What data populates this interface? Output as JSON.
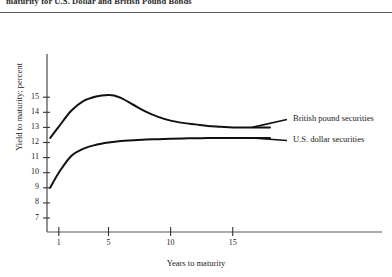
{
  "figure": {
    "top_caption": "maturity for U.S. Dollar and British Pound Bonds",
    "xaxis_title": "Years to maturity",
    "yaxis_title": "Yield to maturity; percent"
  },
  "chart_data": {
    "type": "line",
    "title": "maturity for U.S. Dollar and British Pound Bonds",
    "xlabel": "Years to maturity",
    "ylabel": "Yield to maturity; percent",
    "xlim": [
      0,
      19
    ],
    "ylim": [
      6.5,
      15.8
    ],
    "xticks": [
      1,
      5,
      10,
      15
    ],
    "xtick_labels": [
      "1",
      "5",
      "10",
      "15"
    ],
    "yticks": [
      7,
      8,
      9,
      10,
      11,
      12,
      13,
      14,
      15
    ],
    "ytick_labels": [
      "7",
      "8",
      "9",
      "10",
      "11",
      "12",
      "13",
      "14",
      "15"
    ],
    "grid": false,
    "legend_position": "right-inline",
    "series": [
      {
        "name": "British pound securities",
        "label": "British pound securities",
        "color": "#111111",
        "x": [
          0.3,
          1,
          2,
          3,
          4,
          5,
          5.5,
          6,
          7,
          8,
          9,
          10,
          11,
          12,
          13,
          14,
          15,
          16,
          17,
          18
        ],
        "values": [
          12.3,
          13.05,
          14.1,
          14.75,
          15.05,
          15.15,
          15.1,
          14.95,
          14.5,
          14.05,
          13.7,
          13.45,
          13.3,
          13.2,
          13.1,
          13.05,
          13.0,
          13.0,
          13.0,
          13.0
        ]
      },
      {
        "name": "U.S. dollar securities",
        "label": "U.S. dollar securities",
        "color": "#111111",
        "x": [
          0.3,
          1,
          2,
          3,
          4,
          5,
          6,
          7,
          8,
          9,
          10,
          11,
          12,
          13,
          14,
          15,
          16,
          17,
          18
        ],
        "values": [
          9.0,
          10.0,
          11.1,
          11.6,
          11.85,
          12.0,
          12.1,
          12.15,
          12.2,
          12.22,
          12.25,
          12.27,
          12.28,
          12.3,
          12.3,
          12.3,
          12.3,
          12.3,
          12.3
        ]
      }
    ]
  }
}
